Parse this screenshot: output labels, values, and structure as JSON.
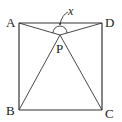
{
  "figure": {
    "type": "geometry",
    "shape": "square",
    "vertices": {
      "A": "A",
      "B": "B",
      "C": "C",
      "D": "D"
    },
    "interior_point": "P",
    "angle_label": "x",
    "segments": [
      "AB",
      "BC",
      "CD",
      "DA",
      "PA",
      "PB",
      "PC",
      "PD"
    ],
    "marked_angle": "APD"
  },
  "colors": {
    "stroke": "#333333",
    "text": "#222222",
    "background": "#ffffff"
  }
}
